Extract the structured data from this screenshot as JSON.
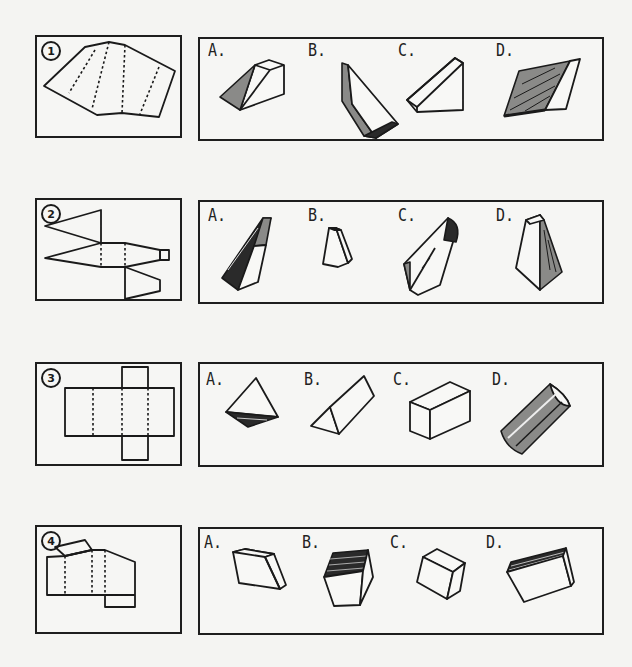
{
  "page": {
    "type": "spatial-reasoning test: choose the solid formed by folding the net",
    "questions": [
      {
        "number": "1",
        "net": "parallelogram strip net with three diagonal dashed fold lines",
        "options": [
          {
            "label": "A.",
            "shape": "wedge / triangular prism, shaded end"
          },
          {
            "label": "B.",
            "shape": "long slanted thin prism, shaded side"
          },
          {
            "label": "C.",
            "shape": "slanted triangular wedge, unshaded"
          },
          {
            "label": "D.",
            "shape": "flattened parallelogram prism, heavily shaded face"
          }
        ]
      },
      {
        "number": "2",
        "net": "trapezoid net with three trapezoidal flaps and small square tab",
        "options": [
          {
            "label": "A.",
            "shape": "slanted pentagonal prism, shaded left faces"
          },
          {
            "label": "B.",
            "shape": "small truncated pyramid (frustum)"
          },
          {
            "label": "C.",
            "shape": "pentagonal solid with dark top face"
          },
          {
            "label": "D.",
            "shape": "tall frustum, shaded right face"
          }
        ]
      },
      {
        "number": "3",
        "net": "cross-shaped rectangular prism net (4 in a row, 2 tabs)",
        "options": [
          {
            "label": "A.",
            "shape": "tetrahedron, shaded bottom"
          },
          {
            "label": "B.",
            "shape": "triangular prism"
          },
          {
            "label": "C.",
            "shape": "rectangular box"
          },
          {
            "label": "D.",
            "shape": "cylinder segment / half-cylinder, shaded"
          }
        ]
      },
      {
        "number": "4",
        "net": "irregular net with slanted top flap and dashed folds",
        "options": [
          {
            "label": "A.",
            "shape": "truncated wedge block"
          },
          {
            "label": "B.",
            "shape": "cube with hatched top face"
          },
          {
            "label": "C.",
            "shape": "cube-like block, tilted"
          },
          {
            "label": "D.",
            "shape": "flat box with hatched top edge"
          }
        ]
      }
    ]
  }
}
